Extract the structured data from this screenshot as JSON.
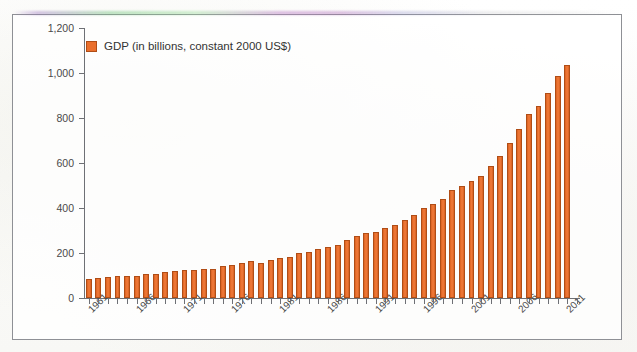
{
  "chart_data": {
    "type": "bar",
    "title": "",
    "subtitle": "",
    "xlabel": "",
    "ylabel": "",
    "legend": [
      "GDP (in billions, constant 2000 US$)"
    ],
    "legend_position": "top-left-inside",
    "grid": false,
    "ylim": [
      0,
      1200
    ],
    "ytick_labels": [
      "0",
      "200",
      "400",
      "600",
      "800",
      "1,000",
      "1,200"
    ],
    "ytick_values": [
      0,
      200,
      400,
      600,
      800,
      1000,
      1200
    ],
    "xtick_labels": [
      "1961",
      "1966",
      "1971",
      "1976",
      "1981",
      "1986",
      "1991",
      "1996",
      "2001",
      "2006",
      "2011"
    ],
    "xtick_values": [
      1961,
      1966,
      1971,
      1976,
      1981,
      1986,
      1991,
      1996,
      2001,
      2006,
      2011
    ],
    "categories": [
      "1961",
      "1962",
      "1963",
      "1964",
      "1965",
      "1966",
      "1967",
      "1968",
      "1969",
      "1970",
      "1971",
      "1972",
      "1973",
      "1974",
      "1975",
      "1976",
      "1977",
      "1978",
      "1979",
      "1980",
      "1981",
      "1982",
      "1983",
      "1984",
      "1985",
      "1986",
      "1987",
      "1988",
      "1989",
      "1990",
      "1991",
      "1992",
      "1993",
      "1994",
      "1995",
      "1996",
      "1997",
      "1998",
      "1999",
      "2000",
      "2001",
      "2002",
      "2003",
      "2004",
      "2005",
      "2006",
      "2007",
      "2008",
      "2009",
      "2010",
      "2011"
    ],
    "series": [
      {
        "name": "GDP (in billions, constant 2000 US$)",
        "color": "#ea6f2c",
        "values": [
          85,
          88,
          93,
          100,
          97,
          98,
          105,
          108,
          115,
          122,
          124,
          123,
          129,
          131,
          143,
          145,
          155,
          164,
          156,
          167,
          178,
          184,
          198,
          206,
          216,
          226,
          236,
          260,
          276,
          291,
          294,
          310,
          325,
          345,
          371,
          400,
          416,
          441,
          478,
          498,
          522,
          543,
          588,
          632,
          690,
          750,
          820,
          855,
          910,
          985,
          1035
        ]
      }
    ]
  },
  "legend": {
    "swatch_name": "legend-color-swatch",
    "label": "GDP (in billions, constant 2000 US$)"
  },
  "colors": {
    "bar": "#ea6f2c",
    "bar_edge": "#b04d16",
    "axis": "#6e7075",
    "text": "#4a4a4a",
    "frame": "#8e9095",
    "background": "#fdfdfc"
  }
}
